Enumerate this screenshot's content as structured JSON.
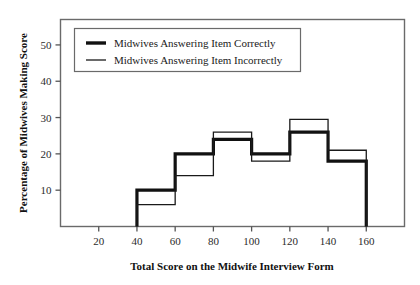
{
  "chart_data": {
    "type": "line",
    "title": "",
    "subtitle": "",
    "xlabel": "Total Score on the Midwife Interview Form",
    "ylabel": "Percentage of Midwives Making Score",
    "xlim": [
      0,
      180
    ],
    "ylim": [
      0,
      57
    ],
    "xticks": [
      20,
      40,
      60,
      80,
      100,
      120,
      140,
      160
    ],
    "yticks": [
      10,
      20,
      30,
      40,
      50
    ],
    "grid": false,
    "legend_position": "top-left",
    "bin_edges": [
      40,
      60,
      80,
      100,
      120,
      140,
      160
    ],
    "categories": [
      "40-60",
      "60-80",
      "80-100",
      "100-120",
      "120-140",
      "140-160"
    ],
    "series": [
      {
        "name": "Midwives Answering Item Correctly",
        "style": "thick",
        "color": "#111111",
        "values": [
          10,
          20,
          24,
          20,
          26,
          18
        ]
      },
      {
        "name": "Midwives Answering Item Incorrectly",
        "style": "thin",
        "color": "#1a1a1a",
        "values": [
          6,
          14,
          26,
          18,
          29.5,
          21
        ]
      }
    ]
  },
  "axes": {
    "x_title": "Total Score on the Midwife Interview Form",
    "y_title": "Percentage of Midwives Making Score",
    "x_tick_labels": [
      "20",
      "40",
      "60",
      "80",
      "100",
      "120",
      "140",
      "160"
    ],
    "y_tick_labels": [
      "10",
      "20",
      "30",
      "40",
      "50"
    ]
  },
  "legend": {
    "items": [
      {
        "label": "Midwives Answering Item Correctly",
        "style": "thick"
      },
      {
        "label": "Midwives Answering Item Incorrectly",
        "style": "thin"
      }
    ]
  },
  "colors": {
    "line_correct": "#111111",
    "line_incorrect": "#1a1a1a",
    "axis": "#555555",
    "background": "#ffffff"
  }
}
